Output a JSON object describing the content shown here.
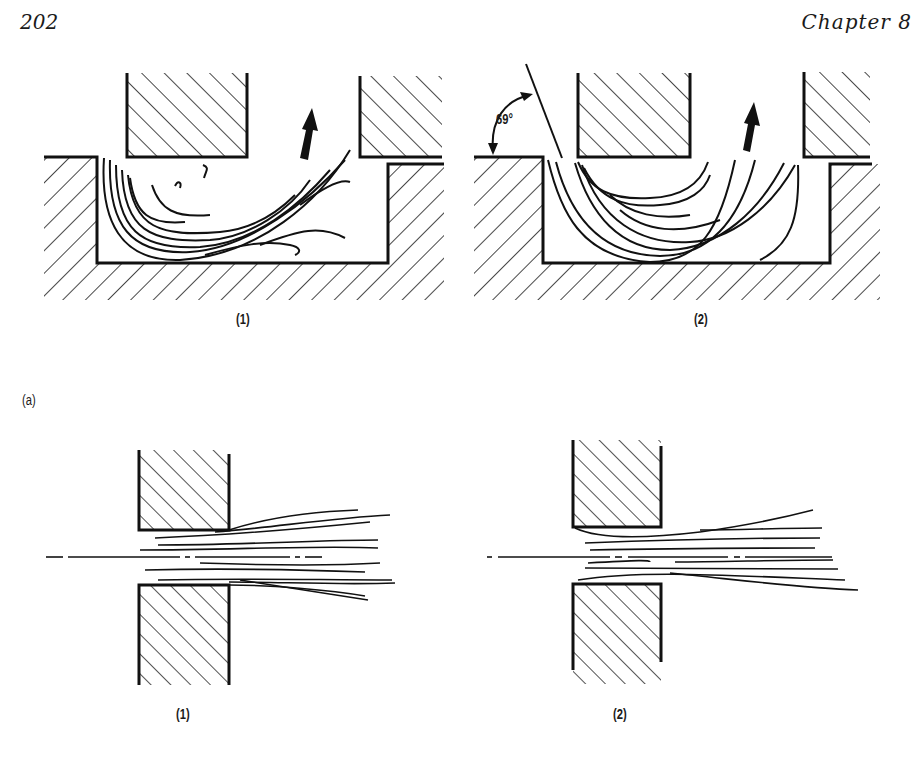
{
  "header": {
    "page_number": "202",
    "chapter": "Chapter 8"
  },
  "figure": {
    "part_label": "(a)",
    "top_row": {
      "left_caption": "(1)",
      "right_caption": "(2)",
      "angle_annotation": "69°"
    },
    "bottom_row": {
      "left_caption": "(1)",
      "right_caption": "(2)"
    }
  }
}
